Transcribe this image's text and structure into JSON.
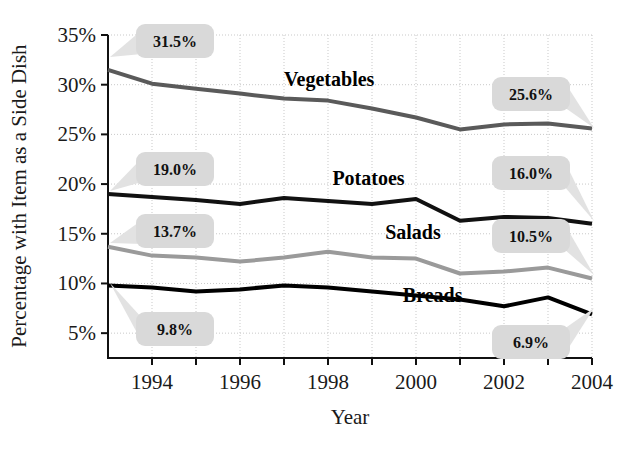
{
  "chart_data": {
    "type": "line",
    "title": "",
    "xlabel": "Year",
    "ylabel": "Percentage with Item as a Side Dish",
    "x": [
      1993,
      1994,
      1995,
      1996,
      1997,
      1998,
      1999,
      2000,
      2001,
      2002,
      2003,
      2004
    ],
    "xlim": [
      1993,
      2004
    ],
    "ylim": [
      2.5,
      35
    ],
    "yticks": [
      5,
      10,
      15,
      20,
      25,
      30,
      35
    ],
    "ytick_labels": [
      "5%",
      "10%",
      "15%",
      "20%",
      "25%",
      "30%",
      "35%"
    ],
    "xticks": [
      1994,
      1996,
      1998,
      2000,
      2002,
      2004
    ],
    "xtick_labels": [
      "1994",
      "1996",
      "1998",
      "2000",
      "2002",
      "2004"
    ],
    "grid": true,
    "legend": "inline-labels",
    "series": [
      {
        "name": "Vegetables",
        "color": "#5a5a5a",
        "width": 4,
        "values": [
          31.5,
          30.1,
          29.6,
          29.1,
          28.6,
          28.4,
          27.6,
          26.7,
          25.5,
          26.0,
          26.1,
          25.6
        ]
      },
      {
        "name": "Potatoes",
        "color": "#111111",
        "width": 4,
        "values": [
          19.0,
          18.7,
          18.4,
          18.0,
          18.6,
          18.3,
          18.0,
          18.5,
          16.3,
          16.7,
          16.6,
          16.0
        ]
      },
      {
        "name": "Salads",
        "color": "#9a9a9a",
        "width": 4,
        "values": [
          13.7,
          12.8,
          12.6,
          12.2,
          12.6,
          13.2,
          12.6,
          12.5,
          11.0,
          11.2,
          11.6,
          10.5
        ]
      },
      {
        "name": "Breads",
        "color": "#000000",
        "width": 4,
        "values": [
          9.8,
          9.6,
          9.2,
          9.4,
          9.8,
          9.6,
          9.2,
          8.8,
          8.4,
          7.7,
          8.6,
          6.9
        ]
      }
    ],
    "series_labels": [
      {
        "text": "Vegetables",
        "x": 1997.0,
        "y": 29.9
      },
      {
        "text": "Potatoes",
        "x": 1998.1,
        "y": 19.9
      },
      {
        "text": "Salads",
        "x": 1999.3,
        "y": 14.5
      },
      {
        "text": "Breads",
        "x": 1999.7,
        "y": 8.1
      }
    ],
    "annotations": [
      {
        "text": "31.5%",
        "value": 31.5,
        "series": "Vegetables",
        "side": "left",
        "box_x": 136,
        "box_y": 24,
        "anchor_x": 110,
        "anchor_y": 57
      },
      {
        "text": "19.0%",
        "value": 19.0,
        "series": "Potatoes",
        "side": "left",
        "box_x": 136,
        "box_y": 152,
        "anchor_x": 110,
        "anchor_y": 191
      },
      {
        "text": "13.7%",
        "value": 13.7,
        "series": "Salads",
        "side": "left",
        "box_x": 136,
        "box_y": 214,
        "anchor_x": 110,
        "anchor_y": 243
      },
      {
        "text": "9.8%",
        "value": 9.8,
        "series": "Breads",
        "side": "left",
        "box_x": 136,
        "box_y": 312,
        "anchor_x": 110,
        "anchor_y": 283
      },
      {
        "text": "25.6%",
        "value": 25.6,
        "series": "Vegetables",
        "side": "right",
        "box_x": 492,
        "box_y": 77,
        "anchor_x": 594,
        "anchor_y": 128
      },
      {
        "text": "16.0%",
        "value": 16.0,
        "series": "Potatoes",
        "side": "right",
        "box_x": 492,
        "box_y": 156,
        "anchor_x": 594,
        "anchor_y": 221
      },
      {
        "text": "10.5%",
        "value": 10.5,
        "series": "Salads",
        "side": "right",
        "box_x": 492,
        "box_y": 219,
        "anchor_x": 594,
        "anchor_y": 275
      },
      {
        "text": "6.9%",
        "value": 6.9,
        "series": "Breads",
        "side": "right",
        "box_x": 492,
        "box_y": 325,
        "anchor_x": 594,
        "anchor_y": 308
      }
    ]
  },
  "plot": {
    "left": 108,
    "right": 592,
    "top": 35,
    "bottom": 358,
    "axis_color": "#111111",
    "grid_color": "#c9c9c9",
    "background": "#ffffff"
  }
}
